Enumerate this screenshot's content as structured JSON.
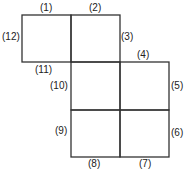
{
  "diagram": {
    "labels": {
      "e1": "(1)",
      "e2": "(2)",
      "e3": "(3)",
      "e4": "(4)",
      "e5": "(5)",
      "e6": "(6)",
      "e7": "(7)",
      "e8": "(8)",
      "e9": "(9)",
      "e10": "(10)",
      "e11": "(11)",
      "e12": "(12)"
    },
    "line_color": "#333333"
  }
}
